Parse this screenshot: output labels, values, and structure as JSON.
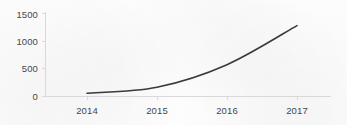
{
  "chart_data": {
    "type": "line",
    "title": "",
    "subtitle": "",
    "xlabel": "",
    "ylabel": "",
    "categories": [
      "2014",
      "2015",
      "2016",
      "2017"
    ],
    "x_tick_labels": [
      "2014",
      "2015",
      "2016",
      "2017"
    ],
    "y_tick_labels": [
      "0",
      "500",
      "1000",
      "1500"
    ],
    "y_ticks": [
      0,
      500,
      1000,
      1500
    ],
    "ylim": [
      0,
      1500
    ],
    "grid": false,
    "legend": false,
    "legend_position": "none",
    "annotations": [],
    "series": [
      {
        "name": "",
        "values": [
          50,
          160,
          570,
          1280
        ]
      }
    ],
    "colors": {
      "line": "#3a3a3a",
      "axis": "#d9d9d9",
      "text": "#474747",
      "background": "#fdfdfd"
    }
  }
}
